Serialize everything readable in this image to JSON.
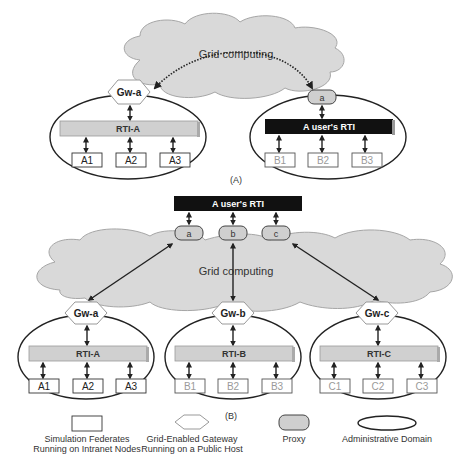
{
  "diagram_a": {
    "caption": "(A)",
    "cloud_label": "Grid computing",
    "gateway": "Gw-a",
    "rti_left": "RTI-A",
    "federates_left": [
      "A1",
      "A2",
      "A3"
    ],
    "proxy": "a",
    "rti_right": "A user's RTI",
    "federates_right": [
      "B1",
      "B2",
      "B3"
    ]
  },
  "diagram_b": {
    "caption": "(B)",
    "user_rti": "A user's RTI",
    "proxies": [
      "a",
      "b",
      "c"
    ],
    "cloud_label": "Grid computing",
    "domains": [
      {
        "gateway": "Gw-a",
        "rti": "RTI-A",
        "federates": [
          "A1",
          "A2",
          "A3"
        ]
      },
      {
        "gateway": "Gw-b",
        "rti": "RTI-B",
        "federates": [
          "B1",
          "B2",
          "B3"
        ]
      },
      {
        "gateway": "Gw-c",
        "rti": "RTI-C",
        "federates": [
          "C1",
          "C2",
          "C3"
        ]
      }
    ]
  },
  "legend": {
    "federate": [
      "Simulation Federates",
      "Running on Intranet Nodes"
    ],
    "gateway": [
      "Grid-Enabled Gateway",
      "Running on a Public Host"
    ],
    "proxy": "Proxy",
    "domain": "Administrative Domain"
  },
  "colors": {
    "cloud_fill": "#d9d9d9",
    "cloud_stroke": "#a6a6a6",
    "rti_fill": "#d0d0d0",
    "user_rti_fill": "#111111",
    "proxy_fill": "#cfcfcf",
    "line": "#222222",
    "faded_text": "#9a9a9a"
  }
}
